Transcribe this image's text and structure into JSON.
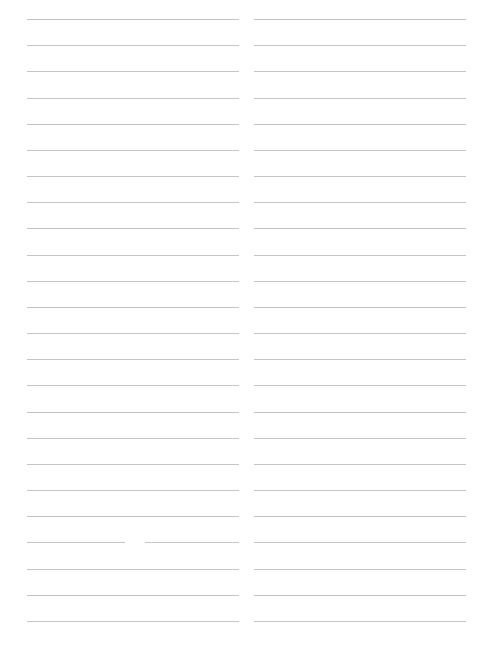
{
  "page": {
    "type": "blank-lined-paper",
    "columns": 2,
    "lines_per_column": 24,
    "first_line_y": 19,
    "line_spacing": 26.17,
    "line_color": "#c4c4c4",
    "background": "#ffffff"
  },
  "columns": [
    {
      "id": "left",
      "x_start": 27,
      "x_end": 239,
      "text_lines": []
    },
    {
      "id": "right",
      "x_start": 254,
      "x_end": 466,
      "text_lines": []
    }
  ],
  "defects": [
    {
      "column": "left",
      "line_index": 20,
      "gap_x_start": 125,
      "gap_x_end": 145
    }
  ]
}
